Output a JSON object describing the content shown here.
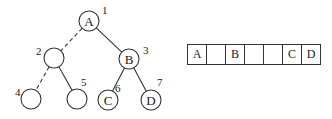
{
  "figure": {
    "tree": {
      "nodes": [
        {
          "index": "1",
          "label": "A",
          "cx": 89,
          "cy": 21,
          "r": 10,
          "idx_x": 102,
          "idx_y": 14
        },
        {
          "index": "2",
          "label": "",
          "cx": 54,
          "cy": 58,
          "r": 10,
          "idx_x": 36,
          "idx_y": 55
        },
        {
          "index": "3",
          "label": "B",
          "cx": 129,
          "cy": 59,
          "r": 10,
          "idx_x": 143,
          "idx_y": 54
        },
        {
          "index": "4",
          "label": "",
          "cx": 31,
          "cy": 99,
          "r": 10,
          "idx_x": 15,
          "idx_y": 96
        },
        {
          "index": "5",
          "label": "",
          "cx": 77,
          "cy": 99,
          "r": 10,
          "idx_x": 81,
          "idx_y": 86
        },
        {
          "index": "6",
          "label": "C",
          "cx": 108,
          "cy": 100,
          "r": 10,
          "idx_x": 115,
          "idx_y": 92
        },
        {
          "index": "7",
          "label": "D",
          "cx": 151,
          "cy": 100,
          "r": 10,
          "idx_x": 157,
          "idx_y": 86
        }
      ],
      "edges": [
        {
          "from": "1",
          "to": "2",
          "style": "dashed"
        },
        {
          "from": "1",
          "to": "3",
          "style": "solid"
        },
        {
          "from": "2",
          "to": "4",
          "style": "dashed"
        },
        {
          "from": "2",
          "to": "5",
          "style": "solid"
        },
        {
          "from": "3",
          "to": "6",
          "style": "solid"
        },
        {
          "from": "3",
          "to": "7",
          "style": "solid"
        }
      ]
    },
    "array": {
      "cells": [
        "A",
        "",
        "B",
        "",
        "",
        "C",
        "D"
      ]
    }
  }
}
